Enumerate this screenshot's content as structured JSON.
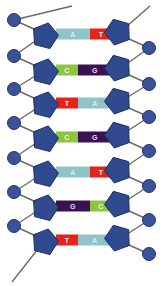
{
  "figure": {
    "width": 162,
    "height": 286,
    "background": "#ffffff"
  },
  "palette": {
    "adenine": "#8fc3c6",
    "thymine": "#e62318",
    "cytosine": "#8cc540",
    "guanine": "#3c1152",
    "sugar": "#2f4a8f",
    "sugar_stroke": "#1b2f63",
    "phosphate": "#3b5298",
    "phosphate_stroke": "#22356e",
    "backbone_line": "#6e6a62",
    "letter_adenine": "#d9f0f2",
    "letter_thymine": "#ffe9e6",
    "letter_cytosine": "#eafbd8",
    "letter_guanine": "#e7d8f0"
  },
  "legend": {
    "adenine_label": "A",
    "thymine_label": "T",
    "cytosine_label": "C",
    "guanine_label": "G"
  },
  "chart_data": {
    "type": "diagram",
    "rungs": [
      {
        "index": 1,
        "y": 34,
        "left_base": "A",
        "right_base": "T",
        "left_kind": "purine",
        "right_kind": "pyrimidine"
      },
      {
        "index": 2,
        "y": 70,
        "left_base": "C",
        "right_base": "G",
        "left_kind": "pyrimidine",
        "right_kind": "purine"
      },
      {
        "index": 3,
        "y": 103,
        "left_base": "T",
        "right_base": "A",
        "left_kind": "pyrimidine",
        "right_kind": "purine"
      },
      {
        "index": 4,
        "y": 137,
        "left_base": "C",
        "right_base": "G",
        "left_kind": "pyrimidine",
        "right_kind": "purine"
      },
      {
        "index": 5,
        "y": 172,
        "left_base": "A",
        "right_base": "T",
        "left_kind": "purine",
        "right_kind": "pyrimidine"
      },
      {
        "index": 6,
        "y": 206,
        "left_base": "G",
        "right_base": "C",
        "left_kind": "purine",
        "right_kind": "pyrimidine"
      },
      {
        "index": 7,
        "y": 240,
        "left_base": "T",
        "right_base": "A",
        "left_kind": "pyrimidine",
        "right_kind": "purine"
      }
    ],
    "left_strand_sequence": [
      "A",
      "C",
      "T",
      "C",
      "A",
      "G",
      "T"
    ],
    "right_strand_sequence": [
      "T",
      "G",
      "A",
      "G",
      "T",
      "C",
      "A"
    ],
    "left_backbone": {
      "sugars_x": 45,
      "phosphates_x": 14,
      "count": 7
    },
    "right_backbone": {
      "sugars_x": 118,
      "phosphates_x": 149,
      "count": 7
    }
  }
}
